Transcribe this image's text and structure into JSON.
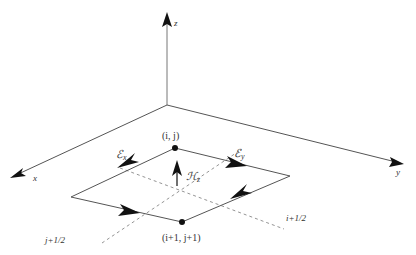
{
  "diagram": {
    "title": "",
    "axes": {
      "x": {
        "label": "x"
      },
      "y": {
        "label": "y"
      },
      "z": {
        "label": "z"
      }
    },
    "nodes": [
      {
        "id": "top",
        "label": "(i, j)"
      },
      {
        "id": "bottom",
        "label": "(i+1, j+1)"
      }
    ],
    "fields": {
      "ex": {
        "symbol": "ℰ",
        "sub": "x"
      },
      "ey": {
        "symbol": "ℰ",
        "sub": "y"
      },
      "hz": {
        "symbol": "ℋ",
        "sub": "z"
      }
    },
    "dashed_labels": {
      "i_half": "i+1/2",
      "j_half": "j+1/2"
    },
    "colors": {
      "line": "#555555",
      "arrow": "#111111",
      "dashed": "#777777",
      "text": "#333333"
    }
  }
}
